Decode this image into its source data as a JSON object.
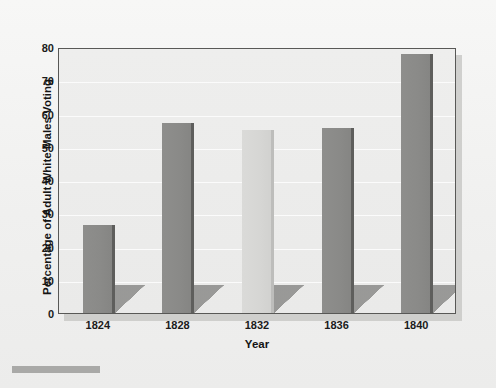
{
  "chart_data": {
    "type": "bar",
    "title": "",
    "subtitle": "",
    "xlabel": "Year",
    "ylabel": "Percentage of Adult White Males Voting",
    "categories": [
      "1824",
      "1828",
      "1832",
      "1836",
      "1840"
    ],
    "values": [
      26.5,
      57,
      55,
      55.5,
      78
    ],
    "series": [
      {
        "name": "Percentage of Adult White Males Voting",
        "values": [
          26.5,
          57,
          55,
          55.5,
          78
        ]
      }
    ],
    "ylim": [
      0,
      80
    ],
    "xlim_categories": 5,
    "ytick_labels": [
      "0",
      "10",
      "20",
      "30",
      "40",
      "50",
      "60",
      "70",
      "80"
    ],
    "ytick_values": [
      0,
      10,
      20,
      30,
      40,
      50,
      60,
      70,
      80
    ],
    "xtick_labels": [
      "1824",
      "1828",
      "1832",
      "1836",
      "1840"
    ],
    "grid": true,
    "grid_axis": "y",
    "legend": false,
    "legend_position": "none",
    "bar_styles": [
      "dark",
      "dark",
      "light",
      "dark",
      "dark"
    ],
    "annotations": []
  },
  "style": {
    "page_background": "#f2f2f1",
    "plot_background": "#ececeb",
    "frame_color": "#585856",
    "gridline_color": "#fbfbfb",
    "bar_dark_color": "#8a8a88",
    "bar_dark_edge_color": "#5e5e5c",
    "bar_light_color": "#d6d6d4",
    "bar_light_edge_color": "#bdbdbb",
    "shadow_color": "#82827f",
    "text_color": "#1b1b1b",
    "rule_color": "#a9a9a7"
  },
  "footer": {
    "rule_present": true
  }
}
